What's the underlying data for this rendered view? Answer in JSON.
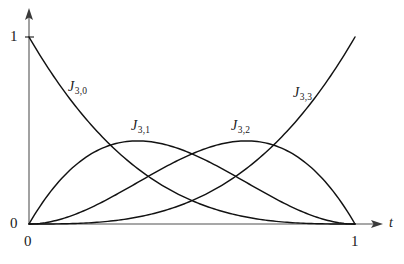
{
  "figure": {
    "title": "",
    "background_color": "#ffffff",
    "curve_color": "#121212",
    "axis_color": "#8a8a8a"
  },
  "axes": {
    "x": {
      "name": "t",
      "tick_labels": [
        "0",
        "1"
      ],
      "origin_label": "0",
      "end_label": "1",
      "arrow": true
    },
    "y": {
      "name": "",
      "tick_labels": [
        "0",
        "1"
      ],
      "origin_label": "0",
      "top_label": "1",
      "arrow": true
    }
  },
  "curve_labels": [
    {
      "base": "J",
      "sub": "3,0"
    },
    {
      "base": "J",
      "sub": "3,1"
    },
    {
      "base": "J",
      "sub": "3,2"
    },
    {
      "base": "J",
      "sub": "3,3"
    }
  ],
  "caption": {
    "text": ""
  },
  "chart_data": {
    "type": "line",
    "title": "",
    "xlabel": "t",
    "ylabel": "",
    "xlim": [
      0,
      1
    ],
    "ylim": [
      0,
      1
    ],
    "grid": false,
    "legend": "inline-labels",
    "x": [
      0,
      0.05,
      0.1,
      0.15,
      0.2,
      0.25,
      0.3,
      0.3333,
      0.35,
      0.4,
      0.45,
      0.5,
      0.55,
      0.6,
      0.65,
      0.6667,
      0.7,
      0.75,
      0.8,
      0.85,
      0.9,
      0.95,
      1
    ],
    "series": [
      {
        "name": "J_{3,0}",
        "label": "J3,0",
        "formula": "(1-t)^3",
        "peak_t": 0,
        "peak_value": 1,
        "values": [
          1,
          0.857,
          0.729,
          0.614,
          0.512,
          0.422,
          0.343,
          0.296,
          0.275,
          0.216,
          0.166,
          0.125,
          0.091,
          0.064,
          0.043,
          0.037,
          0.027,
          0.016,
          0.008,
          0.003,
          0.001,
          0.000125,
          0
        ]
      },
      {
        "name": "J_{3,1}",
        "label": "J3,1",
        "formula": "3t(1-t)^2",
        "peak_t": 0.3333,
        "peak_value": 0.4444,
        "values": [
          0,
          0.135,
          0.243,
          0.325,
          0.384,
          0.422,
          0.441,
          0.444,
          0.444,
          0.432,
          0.408,
          0.375,
          0.334,
          0.288,
          0.239,
          0.222,
          0.189,
          0.141,
          0.096,
          0.057,
          0.027,
          0.007,
          0
        ]
      },
      {
        "name": "J_{3,2}",
        "label": "J3,2",
        "formula": "3t^2(1-t)",
        "peak_t": 0.6667,
        "peak_value": 0.4444,
        "values": [
          0,
          0.007,
          0.027,
          0.057,
          0.096,
          0.141,
          0.189,
          0.222,
          0.239,
          0.288,
          0.334,
          0.375,
          0.408,
          0.432,
          0.444,
          0.444,
          0.441,
          0.422,
          0.384,
          0.325,
          0.243,
          0.135,
          0
        ]
      },
      {
        "name": "J_{3,3}",
        "label": "J3,3",
        "formula": "t^3",
        "peak_t": 1,
        "peak_value": 1,
        "values": [
          0,
          0.000125,
          0.001,
          0.003,
          0.008,
          0.016,
          0.027,
          0.037,
          0.043,
          0.064,
          0.091,
          0.125,
          0.166,
          0.216,
          0.275,
          0.296,
          0.343,
          0.422,
          0.512,
          0.614,
          0.729,
          0.857,
          1
        ]
      }
    ]
  }
}
